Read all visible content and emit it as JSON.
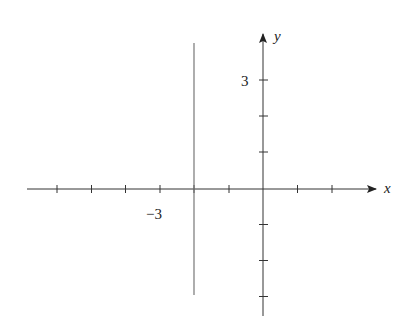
{
  "diagram": {
    "type": "coordinate-plane",
    "x_axis": {
      "label": "x",
      "tick_values": [
        -6,
        -5,
        -4,
        -3,
        -2,
        -1,
        1,
        2
      ],
      "labeled_ticks": [
        {
          "value": -3,
          "text": "−3"
        }
      ]
    },
    "y_axis": {
      "label": "y",
      "tick_values": [
        3,
        2,
        1,
        -1,
        -2,
        -3
      ],
      "labeled_ticks": [
        {
          "value": 3,
          "text": "3"
        }
      ]
    },
    "lines": [
      {
        "kind": "vertical",
        "equation": "x = -2",
        "y_range": [
          -3.1,
          4.2
        ]
      }
    ],
    "colors": {
      "axis": "#333333",
      "line": "#666666"
    }
  }
}
